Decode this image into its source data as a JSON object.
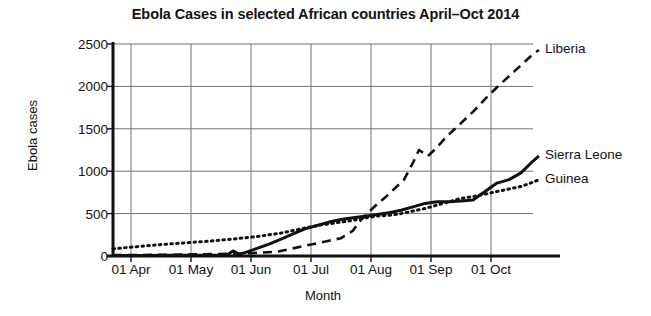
{
  "chart_data": {
    "type": "line",
    "title": "Ebola Cases in selected African countries April–Oct 2014",
    "xlabel": "Month",
    "ylabel": "Ebola cases",
    "xlim": [
      0,
      7
    ],
    "ylim": [
      0,
      2500
    ],
    "grid": true,
    "legend_position": "right-of-line-ends",
    "categories": [
      "01 Apr",
      "01 May",
      "01 Jun",
      "01 Jul",
      "01 Aug",
      "01 Sep",
      "01 Oct"
    ],
    "xticks": [
      "01 Apr",
      "01 May",
      "01 Jun",
      "01 Jul",
      "01 Aug",
      "01 Sep",
      "01 Oct"
    ],
    "yticks": [
      0,
      500,
      1000,
      1500,
      2000,
      2500
    ],
    "series": [
      {
        "name": "Liberia",
        "style": "dashed",
        "color": "#111111",
        "x": [
          0.0,
          0.5,
          1.0,
          1.5,
          2.0,
          2.25,
          2.5,
          2.75,
          3.0,
          3.2,
          3.4,
          3.6,
          3.8,
          4.0,
          4.1,
          4.25,
          4.4,
          4.55,
          4.7,
          4.85,
          5.0,
          5.1,
          5.25,
          5.4,
          5.55,
          5.7,
          5.85,
          6.0,
          6.2,
          6.4,
          6.6,
          6.8,
          7.0,
          7.1
        ],
        "values": [
          10,
          12,
          15,
          20,
          26,
          33,
          41,
          52,
          90,
          120,
          150,
          180,
          210,
          300,
          400,
          510,
          610,
          700,
          800,
          900,
          1100,
          1250,
          1180,
          1280,
          1400,
          1500,
          1600,
          1700,
          1850,
          1990,
          2120,
          2250,
          2380,
          2430
        ]
      },
      {
        "name": "Sierra Leone",
        "style": "solid",
        "color": "#111111",
        "x": [
          0.0,
          0.5,
          1.0,
          1.5,
          1.9,
          2.0,
          2.1,
          2.2,
          2.4,
          2.6,
          2.8,
          3.0,
          3.2,
          3.4,
          3.6,
          3.8,
          4.0,
          4.2,
          4.4,
          4.6,
          4.8,
          5.0,
          5.2,
          5.4,
          5.6,
          5.8,
          6.0,
          6.2,
          6.4,
          6.6,
          6.8,
          7.0,
          7.1
        ],
        "values": [
          5,
          6,
          8,
          10,
          12,
          60,
          20,
          40,
          90,
          140,
          200,
          260,
          320,
          360,
          400,
          430,
          450,
          470,
          490,
          510,
          540,
          580,
          620,
          640,
          640,
          650,
          660,
          760,
          860,
          900,
          980,
          1120,
          1180
        ]
      },
      {
        "name": "Guinea",
        "style": "dotted",
        "color": "#111111",
        "x": [
          0.0,
          0.4,
          0.8,
          1.2,
          1.6,
          2.0,
          2.4,
          2.8,
          3.0,
          3.2,
          3.5,
          3.8,
          4.0,
          4.2,
          4.4,
          4.6,
          4.8,
          5.0,
          5.2,
          5.4,
          5.6,
          5.8,
          6.0,
          6.2,
          6.4,
          6.6,
          6.8,
          7.0,
          7.1
        ],
        "values": [
          85,
          110,
          135,
          155,
          175,
          200,
          230,
          270,
          300,
          330,
          370,
          400,
          420,
          450,
          470,
          480,
          500,
          530,
          560,
          600,
          640,
          680,
          700,
          730,
          760,
          790,
          820,
          870,
          900
        ]
      }
    ]
  }
}
